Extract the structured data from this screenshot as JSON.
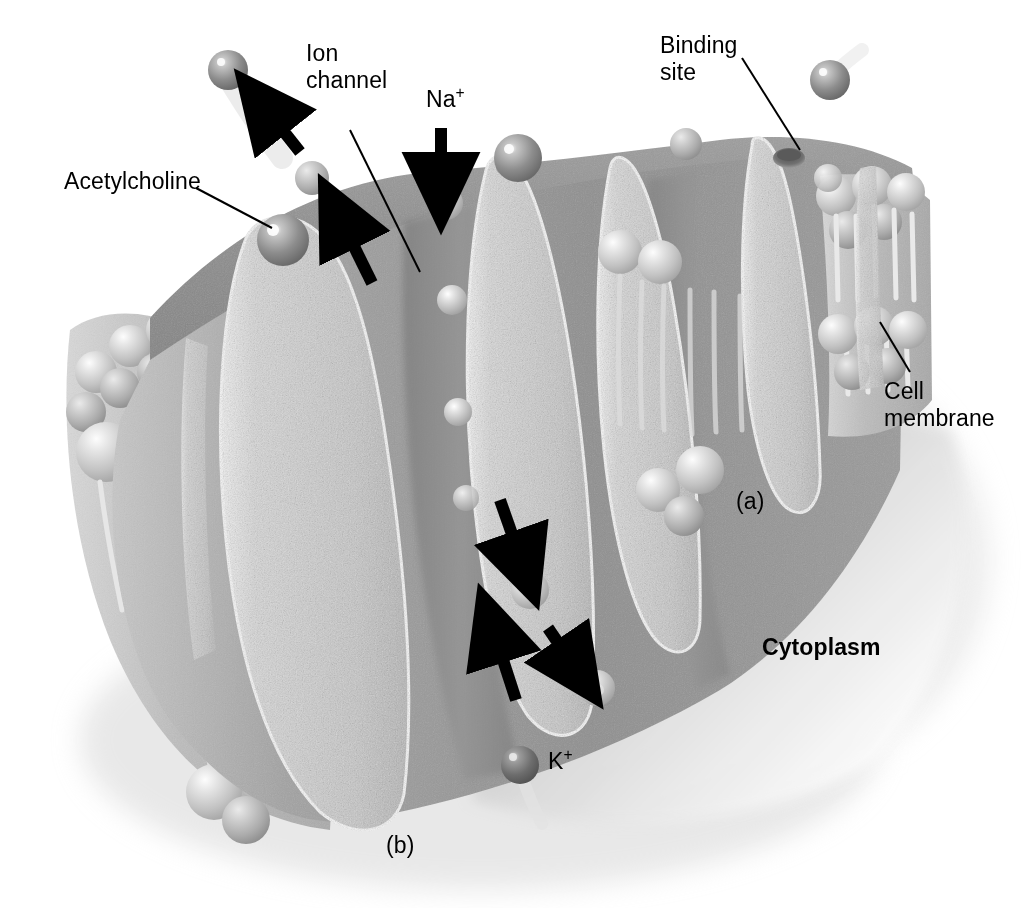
{
  "figure": {
    "domain": "biology-illustration",
    "background_color": "#ffffff"
  },
  "labels": {
    "acetylcholine": "Acetylcholine",
    "ion_channel": "Ion\nchannel",
    "sodium": "Na",
    "sodium_charge": "+",
    "binding_site": "Binding\nsite",
    "cell_membrane": "Cell\nmembrane",
    "cytoplasm": "Cytoplasm",
    "potassium": "K",
    "potassium_charge": "+",
    "panel_a": "(a)",
    "panel_b": "(b)"
  },
  "panels": [
    {
      "id": "a",
      "label": "(a)",
      "meaning": "closed channel - receptor without bound acetylcholine"
    },
    {
      "id": "b",
      "label": "(b)",
      "meaning": "open channel - acetylcholine bound, ions flow"
    }
  ],
  "ions": [
    {
      "name": "Na",
      "charge": "+",
      "direction": "into cell",
      "color": "#c9c9c9"
    },
    {
      "name": "K",
      "charge": "+",
      "direction": "out of cell",
      "color": "#7e7e7e"
    }
  ],
  "colors": {
    "membrane_dark": "#8d8d8d",
    "membrane_mid": "#a3a3a3",
    "membrane_light": "#bdbdbd",
    "protein_fill": "#cfcfcf",
    "protein_edge": "#f2f2f2",
    "lipid_head": "#d6d6d6",
    "lipid_tail": "#e3e3e3",
    "ach_sphere": "#8a8a8a",
    "k_sphere": "#6f6f6f",
    "na_sphere": "#d8d8d8",
    "label_text": "#000000",
    "leader_line": "#000000",
    "arrow": "#000000"
  },
  "arrows": [
    {
      "name": "ach-release-arrow",
      "direction": "up-left",
      "meaning": "acetylcholine leaving"
    },
    {
      "name": "ach-binding-arrow",
      "direction": "up-left",
      "meaning": "acetylcholine approaching receptor"
    },
    {
      "name": "sodium-influx-arrow",
      "direction": "down",
      "meaning": "Na+ entering cell"
    },
    {
      "name": "na-inward-arrow",
      "direction": "down-right",
      "meaning": "Na+ moving into cytoplasm"
    },
    {
      "name": "k-efflux-arrow",
      "direction": "up",
      "meaning": "K+ leaving cytoplasm"
    },
    {
      "name": "k-exit-arrow",
      "direction": "down-right",
      "meaning": "K+ exiting channel"
    }
  ],
  "structures": [
    {
      "name": "phospholipid-bilayer",
      "description": "two leaflets of spherical heads with tails"
    },
    {
      "name": "receptor-protein-subunits",
      "count": 6,
      "description": "speckled elongated transmembrane subunits"
    },
    {
      "name": "channel-pore",
      "description": "central gap between subunits"
    },
    {
      "name": "binding-site-notch",
      "description": "dark recess on top of subunit"
    }
  ]
}
